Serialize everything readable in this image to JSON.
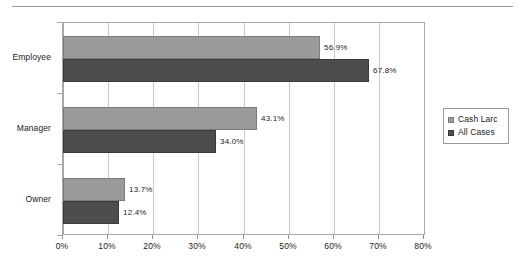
{
  "chart_data": {
    "type": "bar",
    "orientation": "horizontal",
    "title": "",
    "subtitle": "",
    "xlabel": "",
    "ylabel": "",
    "categories": [
      "Employee",
      "Manager",
      "Owner"
    ],
    "series": [
      {
        "name": "Cash Larc",
        "color": "#9b9b9b",
        "values": [
          56.9,
          43.1,
          13.7
        ],
        "labels": [
          "56.9%",
          "43.1%",
          "13.7%"
        ]
      },
      {
        "name": "All Cases",
        "color": "#4d4d4d",
        "values": [
          67.8,
          34.0,
          12.4
        ],
        "labels": [
          "67.8%",
          "34.0%",
          "12.4%"
        ]
      }
    ],
    "xlim": [
      0,
      80
    ],
    "xticks": [
      0,
      10,
      20,
      30,
      40,
      50,
      60,
      70,
      80
    ],
    "xtick_labels": [
      "0%",
      "10%",
      "20%",
      "30%",
      "40%",
      "50%",
      "60%",
      "70%",
      "80%"
    ],
    "grid": true,
    "grid_axis": "x",
    "legend_position": "right",
    "data_labels_shown": true
  },
  "legend": {
    "entries": [
      {
        "label": "Cash Larc",
        "swatch": "series-0-swatch"
      },
      {
        "label": "All Cases",
        "swatch": "series-1-swatch"
      }
    ]
  },
  "axes": {
    "category_labels": [
      "Employee",
      "Manager",
      "Owner"
    ],
    "value_tick_labels": [
      "0%",
      "10%",
      "20%",
      "30%",
      "40%",
      "50%",
      "60%",
      "70%",
      "80%"
    ]
  },
  "colors": {
    "series_cash_larc": "#9b9b9b",
    "series_all_cases": "#4d4d4d",
    "gridline": "#c9c9c9",
    "frame": "#a8a8a8",
    "rule": "#9a9a9a",
    "text": "#1a1a1a"
  }
}
